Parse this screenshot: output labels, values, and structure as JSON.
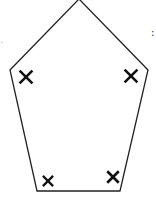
{
  "diagram": {
    "type": "pentagon",
    "stroke_color": "#222222",
    "background": "#ffffff",
    "vertices": [
      {
        "name": "top",
        "x": 79,
        "y": -1
      },
      {
        "name": "right",
        "x": 148,
        "y": 70
      },
      {
        "name": "bottom-right",
        "x": 120,
        "y": 191
      },
      {
        "name": "bottom-left",
        "x": 37,
        "y": 191
      },
      {
        "name": "left",
        "x": 10,
        "y": 70
      }
    ],
    "angle_marks": [
      {
        "corner": "left",
        "symbol": "×",
        "x": 26,
        "y": 77,
        "size": 20
      },
      {
        "corner": "right",
        "symbol": "×",
        "x": 131,
        "y": 76,
        "size": 20
      },
      {
        "corner": "bottom-left",
        "symbol": "×",
        "x": 48,
        "y": 181,
        "size": 16
      },
      {
        "corner": "bottom-right",
        "symbol": "×",
        "x": 113,
        "y": 177,
        "size": 18
      }
    ],
    "edge_fragments": {
      "right": ":",
      "left": "·"
    }
  }
}
